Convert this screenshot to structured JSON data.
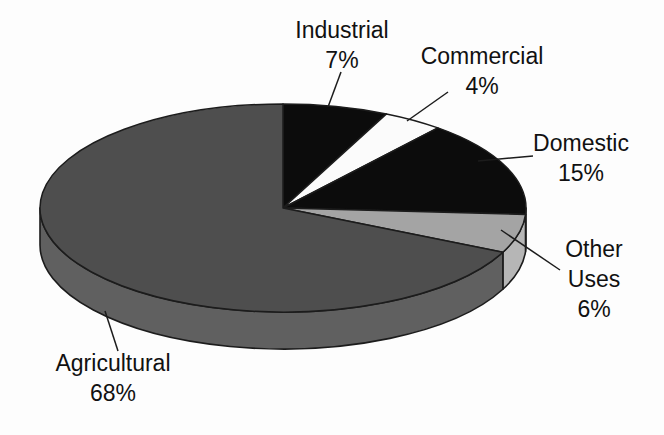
{
  "chart_data": {
    "type": "pie",
    "style": "3d",
    "title": "",
    "unit": "%",
    "direction": "clockwise",
    "start_angle_deg": 0,
    "legend": "none",
    "segments": [
      {
        "label": "Industrial",
        "value": 7,
        "pct_label": "7%",
        "color": "#0c0c0c",
        "side_color": "#0c0c0c",
        "lines": [
          "Industrial",
          "7%"
        ]
      },
      {
        "label": "Commercial",
        "value": 4,
        "pct_label": "4%",
        "color": "#fbfbfb",
        "side_color": "#fbfbfb",
        "lines": [
          "Commercial",
          "4%"
        ]
      },
      {
        "label": "Domestic",
        "value": 15,
        "pct_label": "15%",
        "color": "#0c0c0c",
        "side_color": "#161616",
        "lines": [
          "Domestic",
          "15%"
        ]
      },
      {
        "label": "Other Uses",
        "value": 6,
        "pct_label": "6%",
        "color": "#a4a4a4",
        "side_color": "#b6b6b6",
        "lines": [
          "Other",
          "Uses",
          "6%"
        ]
      },
      {
        "label": "Agricultural",
        "value": 68,
        "pct_label": "68%",
        "color": "#4e4e4e",
        "side_color": "#606060",
        "lines": [
          "Agricultural",
          "68%"
        ]
      }
    ]
  },
  "colors": {
    "background": "#fdfdfd",
    "outline": "#1c1c1c",
    "text": "#111111"
  }
}
